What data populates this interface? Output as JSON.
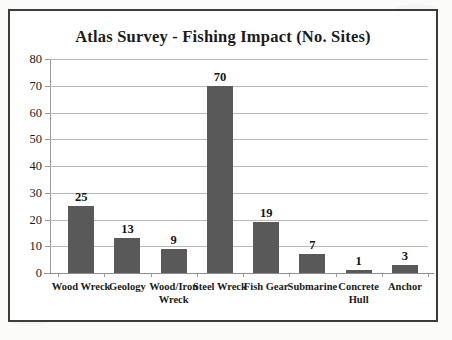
{
  "chart_data": {
    "type": "bar",
    "title": "Atlas Survey - Fishing Impact (No. Sites)",
    "xlabel": "",
    "ylabel": "",
    "ylim": [
      0,
      80
    ],
    "ytick_step": 10,
    "yticks": [
      0,
      10,
      20,
      30,
      40,
      50,
      60,
      70,
      80
    ],
    "grid": true,
    "legend": false,
    "bar_color": "#595959",
    "categories": [
      "Wood Wreck",
      "Geology",
      "Wood/Iron Wreck",
      "Steel Wreck",
      "Fish Gear",
      "Submarine",
      "Concrete Hull",
      "Anchor"
    ],
    "values": [
      25,
      13,
      9,
      70,
      19,
      7,
      1,
      3
    ],
    "data_labels": [
      "25",
      "13",
      "9",
      "70",
      "19",
      "7",
      "1",
      "3"
    ],
    "tick_labels": [
      "0",
      "10",
      "20",
      "30",
      "40",
      "50",
      "60",
      "70",
      "80"
    ]
  }
}
